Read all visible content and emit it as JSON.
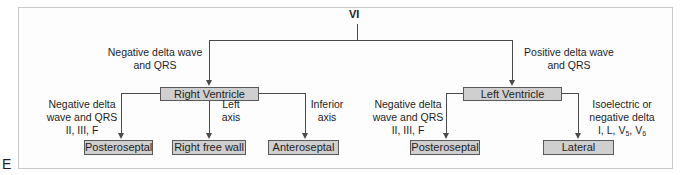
{
  "panel_label": "E",
  "root": "VI",
  "branches": {
    "right": {
      "edge_label_line1": "Negative delta wave",
      "edge_label_line2": "and QRS",
      "node": "Right Ventricle",
      "children": [
        {
          "edge_lines": [
            "Negative delta",
            "wave and QRS",
            "II, III, F"
          ],
          "node": "Posteroseptal"
        },
        {
          "edge_lines": [
            "Left",
            "axis"
          ],
          "node": "Right free wall"
        },
        {
          "edge_lines": [
            "Inferior",
            "axis"
          ],
          "node": "Anteroseptal"
        }
      ]
    },
    "left": {
      "edge_label_line1": "Positive delta wave",
      "edge_label_line2": "and QRS",
      "node": "Left Ventricle",
      "children": [
        {
          "edge_lines": [
            "Negative delta",
            "wave and QRS",
            "II, III, F"
          ],
          "node": "Posteroseptal"
        },
        {
          "edge_lines": [
            "Isoelectric or",
            "negative delta",
            "I, L, V",
            "5",
            ", V",
            "6"
          ],
          "node": "Lateral"
        }
      ]
    }
  },
  "colors": {
    "box_fill": "#cfcfcf",
    "line": "#4a4a4a",
    "frame": "#c9c9c9"
  }
}
